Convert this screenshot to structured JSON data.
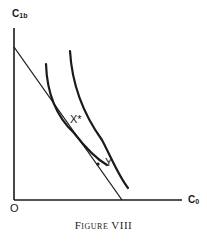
{
  "figure": {
    "caption": "Figure VIII",
    "y_axis_label_main": "C",
    "y_axis_label_sub": "1b",
    "x_axis_label_main": "C",
    "x_axis_label_sub": "0",
    "origin_label": "O",
    "points": {
      "tangency": "X*",
      "other": "Y"
    },
    "colors": {
      "ink": "#1a1a1a",
      "background": "#ffffff"
    }
  },
  "diagram": {
    "type": "indifference-curve diagram",
    "elements": [
      {
        "name": "budget-line",
        "description": "straight line from vertical axis intercept down to horizontal axis intercept"
      },
      {
        "name": "inner-indifference-curve",
        "description": "convex curve tangent to budget line at X*"
      },
      {
        "name": "outer-indifference-curve",
        "description": "higher convex curve above and to the right"
      },
      {
        "name": "point-X-star",
        "label": "X*",
        "description": "tangency point of budget line and inner curve"
      },
      {
        "name": "point-Y",
        "label": "Y",
        "description": "point on budget line below X*"
      }
    ]
  }
}
